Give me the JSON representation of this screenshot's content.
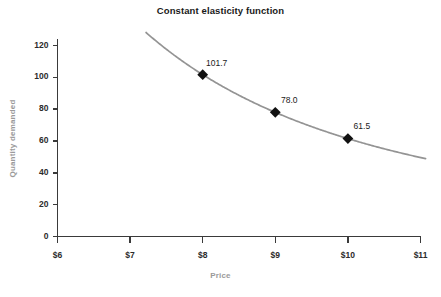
{
  "chart_data": {
    "type": "line",
    "title": "Constant elasticity function",
    "xlabel": "Price",
    "ylabel": "Quantity demanded",
    "xlim": [
      6,
      11
    ],
    "ylim": [
      0,
      126
    ],
    "grid": false,
    "legend": null,
    "x_tick_labels": [
      "$6",
      "$7",
      "$8",
      "$9",
      "$10",
      "$11"
    ],
    "x_ticks": [
      6,
      7,
      8,
      9,
      10,
      11
    ],
    "y_tick_labels": [
      "0",
      "20",
      "40",
      "60",
      "80",
      "100",
      "120"
    ],
    "y_ticks": [
      0,
      20,
      40,
      60,
      80,
      100,
      120
    ],
    "series": [
      {
        "name": "Quantity demanded",
        "curve_color": "#949494",
        "marker_color": "#111111",
        "x": [
          8,
          9,
          10
        ],
        "values": [
          101.7,
          78.0,
          61.5
        ],
        "point_labels": [
          "101.7",
          "78.0",
          "61.5"
        ],
        "curve_x_start": 7.22,
        "curve_x_end": 11.07
      }
    ],
    "annotations": []
  },
  "colors": {
    "axis": "#3a3a3a",
    "title_text": "#1a1a1a",
    "axis_title_text": "#9a9a9a",
    "tick_text": "#2b2b2b",
    "curve": "#949494",
    "marker": "#111111",
    "background": "#ffffff"
  }
}
